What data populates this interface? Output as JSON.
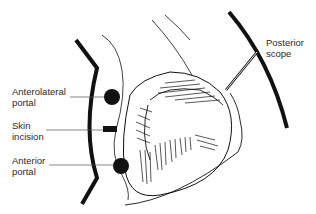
{
  "diagram": {
    "labels": {
      "anterolateral_portal": "Anterolateral\nportal",
      "skin_incision": "Skin\nincision",
      "anterior_portal": "Anterior\nportal",
      "posterior_scope": "Posterior\nscope"
    },
    "colors": {
      "ink": "#111111",
      "label_text": "#2a2a2a",
      "background": "#ffffff"
    }
  }
}
